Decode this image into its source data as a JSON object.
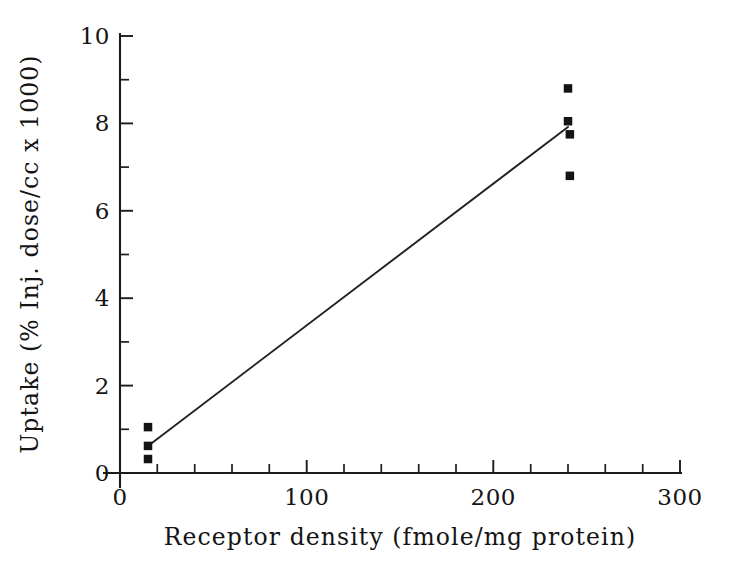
{
  "chart_data": {
    "type": "scatter",
    "title": "",
    "xlabel": "Receptor density (fmole/mg protein)",
    "ylabel": "Uptake (% Inj. dose/cc x 1000)",
    "xlim": [
      0,
      300
    ],
    "ylim": [
      0,
      10
    ],
    "xticks": [
      0,
      100,
      200,
      300
    ],
    "xticklabels": [
      "0",
      "100",
      "200",
      "300"
    ],
    "xminorticks": [
      20,
      40,
      60,
      80,
      120,
      140,
      160,
      180,
      220,
      240,
      260,
      280
    ],
    "yticks": [
      0,
      2,
      4,
      6,
      8,
      10
    ],
    "yticklabels": [
      "0",
      "2",
      "4",
      "6",
      "8",
      "10"
    ],
    "yminorticks": [
      1,
      3,
      5,
      7,
      9
    ],
    "grid": false,
    "legend": null,
    "marker_style": "filled-square",
    "marker_color": "#141414",
    "line_color": "#212121",
    "points": [
      {
        "x": 15,
        "y": 1.05
      },
      {
        "x": 15,
        "y": 0.62
      },
      {
        "x": 15,
        "y": 0.32
      },
      {
        "x": 240,
        "y": 8.8
      },
      {
        "x": 240,
        "y": 8.05
      },
      {
        "x": 241,
        "y": 7.75
      },
      {
        "x": 241,
        "y": 6.8
      }
    ],
    "series": [
      {
        "name": "Uptake vs receptor density",
        "x": [
          15,
          15,
          15,
          240,
          240,
          241,
          241
        ],
        "values": [
          1.05,
          0.62,
          0.32,
          8.8,
          8.05,
          7.75,
          6.8
        ]
      }
    ],
    "fit_line": {
      "type": "linear-regression",
      "x_start": 15,
      "y_start": 0.62,
      "x_end": 240,
      "y_end": 7.92
    }
  },
  "axes": {
    "x_title": "Receptor density (fmole/mg protein)",
    "y_title": "Uptake (% Inj. dose/cc x 1000)"
  }
}
